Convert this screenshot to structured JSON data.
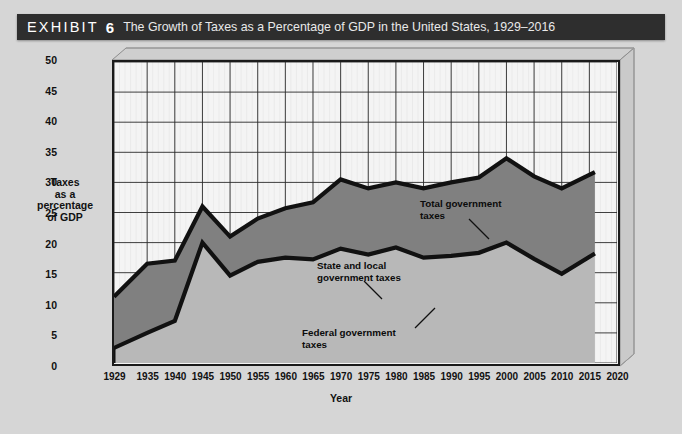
{
  "header": {
    "exhibit_word": "EXHIBIT",
    "exhibit_number": "6",
    "title": "The Growth of Taxes as a Percentage of GDP in the United States, 1929–2016",
    "bar_color": "#2e2e2e",
    "text_color": "#ffffff"
  },
  "page": {
    "background_color": "#d6d6d6"
  },
  "annotations": {
    "total": "Total government\ntaxes",
    "state_local": "State and local\ngovernment taxes",
    "federal": "Federal government\ntaxes"
  },
  "chart_data": {
    "type": "area",
    "title": "The Growth of Taxes as a Percentage of GDP in the United States, 1929–2016",
    "xlabel": "Year",
    "ylabel": "Taxes\nas a\npercentage\nof GDP",
    "ylabel_lines": [
      "Taxes",
      "as a",
      "percentage",
      "of GDP"
    ],
    "xlim": [
      1929,
      2020
    ],
    "ylim": [
      0,
      50
    ],
    "ytick_step": 5,
    "yticks": [
      0,
      5,
      10,
      15,
      20,
      25,
      30,
      35,
      40,
      45,
      50
    ],
    "xticks": [
      1929,
      1935,
      1940,
      1945,
      1950,
      1955,
      1960,
      1965,
      1970,
      1975,
      1980,
      1985,
      1990,
      1995,
      2000,
      2005,
      2010,
      2015,
      2020
    ],
    "grid": true,
    "legend_position": "in-plot-annotations",
    "stacked": true,
    "x": [
      1929,
      1935,
      1940,
      1945,
      1950,
      1955,
      1960,
      1965,
      1970,
      1975,
      1980,
      1985,
      1990,
      1995,
      2000,
      2005,
      2010,
      2016
    ],
    "series": [
      {
        "name": "Federal government taxes",
        "fill_color": "#b8b8b8",
        "line_color": "#111111",
        "values": [
          2.5,
          5.0,
          7.0,
          20.0,
          14.5,
          16.8,
          17.5,
          17.2,
          19.0,
          18.0,
          19.2,
          17.5,
          17.8,
          18.3,
          20.0,
          17.3,
          14.8,
          18.2
        ]
      },
      {
        "name": "State and local government taxes",
        "fill_color": "#808080",
        "line_color": "#111111",
        "values": [
          8.5,
          11.5,
          10.0,
          6.0,
          6.5,
          7.2,
          8.2,
          9.5,
          11.5,
          11.0,
          10.8,
          11.5,
          12.2,
          12.5,
          14.0,
          13.7,
          14.2,
          13.5
        ]
      }
    ],
    "total_series": {
      "name": "Total government taxes",
      "line_color": "#111111",
      "values": [
        11.0,
        16.5,
        17.0,
        26.0,
        21.0,
        24.0,
        25.7,
        26.7,
        30.5,
        29.0,
        30.0,
        29.0,
        30.0,
        30.8,
        34.0,
        31.0,
        29.0,
        31.7
      ]
    }
  },
  "footnote": {
    "text": ""
  }
}
